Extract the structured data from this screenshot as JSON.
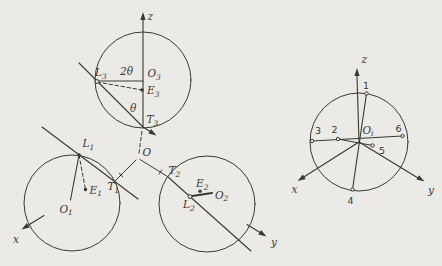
{
  "figure": {
    "colors": {
      "background": "#ebeae6",
      "ink": "#3a3832"
    },
    "main_view": {
      "origin_label": "O",
      "axis_labels": {
        "x": "x",
        "y": "y",
        "z": "z"
      },
      "angle_labels": {
        "double": "2θ",
        "single": "θ"
      },
      "circles": [
        {
          "O": {
            "base": "O",
            "sub": "1"
          },
          "L": {
            "base": "L",
            "sub": "1"
          },
          "E": {
            "base": "E",
            "sub": "1"
          },
          "T": {
            "base": "T",
            "sub": "1"
          }
        },
        {
          "O": {
            "base": "O",
            "sub": "2"
          },
          "L": {
            "base": "L",
            "sub": "2"
          },
          "E": {
            "base": "E",
            "sub": "2"
          },
          "T": {
            "base": "T",
            "sub": "2"
          }
        },
        {
          "O": {
            "base": "O",
            "sub": "3"
          },
          "L": {
            "base": "L",
            "sub": "3"
          },
          "E": {
            "base": "E",
            "sub": "3"
          },
          "T": {
            "base": "T",
            "sub": "3"
          }
        }
      ]
    },
    "inset_view": {
      "center_label": {
        "base": "O",
        "sub": "i"
      },
      "axis_labels": {
        "x": "x",
        "y": "y",
        "z": "z"
      },
      "joint_labels": [
        "1",
        "2",
        "3",
        "4",
        "5",
        "6"
      ]
    }
  }
}
